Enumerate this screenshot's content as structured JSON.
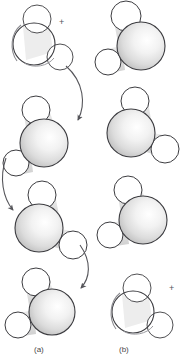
{
  "figure": {
    "title": "",
    "type": "molecular-rotation-diagram",
    "background_color": "#ffffff",
    "outline_color": "#3c3c40",
    "shade_light": "#fefefe",
    "shade_mid": "#e3e3e3",
    "shade_dark": "#b5b5b5",
    "arrow_color": "#55555a"
  },
  "panels": [
    {
      "id": "a",
      "label": "(a)",
      "plus_mark": "+",
      "molecules": [
        {
          "name": "water-molecule",
          "style": "transparent",
          "step": 1,
          "oxygen": {
            "cx": 34,
            "cy": 44,
            "r": 21,
            "shaded": false
          },
          "hydrogens": [
            {
              "cx": 37,
              "cy": 19,
              "r": 14
            },
            {
              "cx": 60,
              "cy": 57,
              "r": 13
            }
          ]
        },
        {
          "name": "water-molecule",
          "style": "shaded",
          "step": 2,
          "oxygen": {
            "cx": 44,
            "cy": 143,
            "r": 24,
            "shaded": true
          },
          "hydrogens": [
            {
              "cx": 36,
              "cy": 110,
              "r": 14
            },
            {
              "cx": 16,
              "cy": 163,
              "r": 13
            }
          ]
        },
        {
          "name": "water-molecule",
          "style": "shaded",
          "step": 3,
          "oxygen": {
            "cx": 39,
            "cy": 228,
            "r": 24,
            "shaded": true
          },
          "hydrogens": [
            {
              "cx": 42,
              "cy": 195,
              "r": 14
            },
            {
              "cx": 73,
              "cy": 245,
              "r": 14
            }
          ]
        },
        {
          "name": "water-molecule",
          "style": "shaded",
          "step": 4,
          "oxygen": {
            "cx": 52,
            "cy": 312,
            "r": 23,
            "shaded": true
          },
          "hydrogens": [
            {
              "cx": 36,
              "cy": 282,
              "r": 14
            },
            {
              "cx": 18,
              "cy": 325,
              "r": 13
            }
          ]
        }
      ],
      "arrows": [
        {
          "name": "rotation-arrow",
          "from_step": 1,
          "to_step": 2
        },
        {
          "name": "rotation-arrow",
          "from_step": 2,
          "to_step": 3
        },
        {
          "name": "rotation-arrow",
          "from_step": 3,
          "to_step": 4
        }
      ]
    },
    {
      "id": "b",
      "label": "(b)",
      "plus_mark": "+",
      "molecules": [
        {
          "name": "water-molecule",
          "style": "shaded",
          "step": 1,
          "oxygen": {
            "cx": 141,
            "cy": 46,
            "r": 24,
            "shaded": true
          },
          "hydrogens": [
            {
              "cx": 126,
              "cy": 16,
              "r": 15
            },
            {
              "cx": 108,
              "cy": 62,
              "r": 13
            }
          ]
        },
        {
          "name": "water-molecule",
          "style": "shaded",
          "step": 2,
          "oxygen": {
            "cx": 131,
            "cy": 133,
            "r": 24,
            "shaded": true
          },
          "hydrogens": [
            {
              "cx": 135,
              "cy": 101,
              "r": 14
            },
            {
              "cx": 165,
              "cy": 149,
              "r": 14
            }
          ]
        },
        {
          "name": "water-molecule",
          "style": "shaded",
          "step": 3,
          "oxygen": {
            "cx": 143,
            "cy": 220,
            "r": 24,
            "shaded": true
          },
          "hydrogens": [
            {
              "cx": 128,
              "cy": 190,
              "r": 14
            },
            {
              "cx": 110,
              "cy": 235,
              "r": 13
            }
          ]
        },
        {
          "name": "water-molecule",
          "style": "transparent",
          "step": 4,
          "oxygen": {
            "cx": 133,
            "cy": 312,
            "r": 21,
            "shaded": false
          },
          "hydrogens": [
            {
              "cx": 137,
              "cy": 288,
              "r": 14
            },
            {
              "cx": 160,
              "cy": 325,
              "r": 13
            }
          ]
        }
      ],
      "arrows": []
    }
  ]
}
